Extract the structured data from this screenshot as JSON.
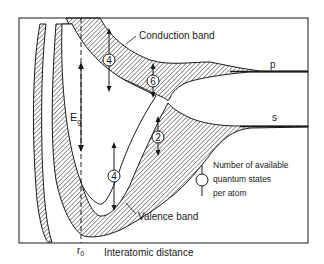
{
  "diagram": {
    "type": "energy band diagram",
    "labels": {
      "conduction_band": "Conduction band",
      "valence_band": "Valence band",
      "p_level": "p",
      "s_level": "s",
      "energy_gap": "E",
      "energy_gap_sub": "g",
      "r0": "r",
      "r0_sub": "0",
      "x_axis": "Interatomic distance"
    },
    "state_counts": {
      "conduction_left": "4",
      "conduction_right": "6",
      "valence_right": "2",
      "valence_left": "4"
    },
    "legend": {
      "line1": "Number of available",
      "line2": "quantum states",
      "line3": "per atom"
    },
    "colors": {
      "ink": "#1a1a1a",
      "background": "#ffffff"
    }
  }
}
